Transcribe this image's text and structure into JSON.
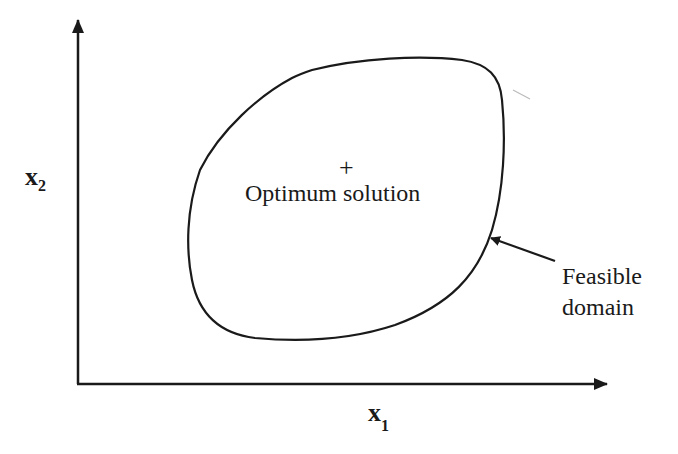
{
  "diagram": {
    "type": "feasible-domain-sketch",
    "axes": {
      "x": {
        "variable": "x",
        "subscript": "1"
      },
      "y": {
        "variable": "x",
        "subscript": "2"
      }
    },
    "region": {
      "label_line1": "Feasible",
      "label_line2": "domain"
    },
    "optimum": {
      "marker": "+",
      "label": "Optimum solution"
    },
    "colors": {
      "stroke": "#1a1a1a",
      "background": "#ffffff"
    }
  }
}
